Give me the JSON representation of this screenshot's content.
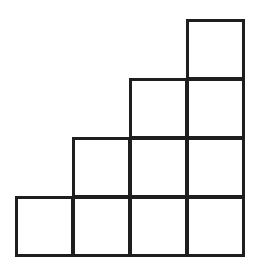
{
  "diagram": {
    "type": "staircase-grid",
    "stroke_color": "#1e1e1e",
    "fill_color": "#ffffff",
    "origin_x": 15,
    "origin_y": 19,
    "cell_w": 57,
    "cell_h": 59,
    "rows": [
      {
        "row": 0,
        "cols": [
          3
        ]
      },
      {
        "row": 1,
        "cols": [
          2,
          3
        ]
      },
      {
        "row": 2,
        "cols": [
          1,
          2,
          3
        ]
      },
      {
        "row": 3,
        "cols": [
          0,
          1,
          2,
          3
        ]
      }
    ],
    "total_squares": 10
  }
}
